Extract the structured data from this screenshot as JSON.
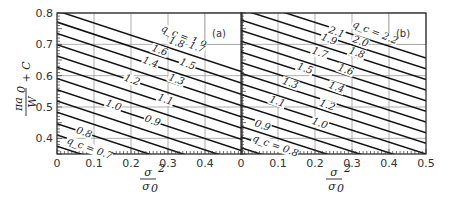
{
  "chart_data": [
    {
      "type": "line",
      "panel": "(a)",
      "title": "",
      "xlabel": "σ² / σ0²",
      "ylabel": "πa0/W + C",
      "xlim": [
        0,
        0.5
      ],
      "ylim": [
        0.35,
        0.8
      ],
      "xticks": [
        "0",
        "0.1",
        "0.2",
        "0.3",
        "0.4"
      ],
      "yticks": [
        "0.4",
        "0.5",
        "0.6",
        "0.7",
        "0.8"
      ],
      "grid": true,
      "legend": "inline curve labels (q_c values)",
      "series": [
        {
          "name": "q_c = 0.7",
          "x": [
            0,
            0.5
          ],
          "y": [
            0.375,
            0.18
          ]
        },
        {
          "name": "0.8",
          "x": [
            0,
            0.5
          ],
          "y": [
            0.411,
            0.216
          ]
        },
        {
          "name": "0.9",
          "x": [
            0,
            0.5
          ],
          "y": [
            0.447,
            0.252
          ]
        },
        {
          "name": "1.0",
          "x": [
            0,
            0.5
          ],
          "y": [
            0.483,
            0.288
          ]
        },
        {
          "name": "1.1",
          "x": [
            0,
            0.5
          ],
          "y": [
            0.519,
            0.324
          ]
        },
        {
          "name": "1.2",
          "x": [
            0,
            0.5
          ],
          "y": [
            0.555,
            0.36
          ]
        },
        {
          "name": "1.3",
          "x": [
            0,
            0.5
          ],
          "y": [
            0.591,
            0.396
          ]
        },
        {
          "name": "1.4",
          "x": [
            0,
            0.5
          ],
          "y": [
            0.627,
            0.432
          ]
        },
        {
          "name": "1.5",
          "x": [
            0,
            0.5
          ],
          "y": [
            0.663,
            0.468
          ]
        },
        {
          "name": "1.6",
          "x": [
            0,
            0.5
          ],
          "y": [
            0.699,
            0.504
          ]
        },
        {
          "name": "1.7",
          "x": [
            0,
            0.5
          ],
          "y": [
            0.735,
            0.54
          ]
        },
        {
          "name": "1.8",
          "x": [
            0,
            0.5
          ],
          "y": [
            0.771,
            0.576
          ]
        },
        {
          "name": "q_c = 1.9",
          "x": [
            0,
            0.5
          ],
          "y": [
            0.807,
            0.612
          ]
        }
      ]
    },
    {
      "type": "line",
      "panel": "(b)",
      "title": "",
      "xlabel": "σ² / σ0²",
      "ylabel": "πa0/W + C",
      "xlim": [
        0,
        0.5
      ],
      "ylim": [
        0.35,
        0.8
      ],
      "xticks": [
        "0",
        "0.1",
        "0.2",
        "0.3",
        "0.4",
        "0.5"
      ],
      "grid": true,
      "legend": "inline curve labels (q_c values)",
      "series": [
        {
          "name": "q_c = 0.8",
          "x": [
            0,
            0.5
          ],
          "y": [
            0.37,
            0.18
          ]
        },
        {
          "name": "0.9",
          "x": [
            0,
            0.5
          ],
          "y": [
            0.404,
            0.214
          ]
        },
        {
          "name": "1.0",
          "x": [
            0,
            0.5
          ],
          "y": [
            0.438,
            0.248
          ]
        },
        {
          "name": "1.1",
          "x": [
            0,
            0.5
          ],
          "y": [
            0.472,
            0.282
          ]
        },
        {
          "name": "1.2",
          "x": [
            0,
            0.5
          ],
          "y": [
            0.506,
            0.316
          ]
        },
        {
          "name": "1.3",
          "x": [
            0,
            0.5
          ],
          "y": [
            0.54,
            0.35
          ]
        },
        {
          "name": "1.4",
          "x": [
            0,
            0.5
          ],
          "y": [
            0.574,
            0.384
          ]
        },
        {
          "name": "1.5",
          "x": [
            0,
            0.5
          ],
          "y": [
            0.608,
            0.418
          ]
        },
        {
          "name": "1.6",
          "x": [
            0,
            0.5
          ],
          "y": [
            0.642,
            0.452
          ]
        },
        {
          "name": "1.7",
          "x": [
            0,
            0.5
          ],
          "y": [
            0.676,
            0.486
          ]
        },
        {
          "name": "1.8",
          "x": [
            0,
            0.5
          ],
          "y": [
            0.71,
            0.52
          ]
        },
        {
          "name": "1.9",
          "x": [
            0,
            0.5
          ],
          "y": [
            0.744,
            0.554
          ]
        },
        {
          "name": "2.0",
          "x": [
            0,
            0.5
          ],
          "y": [
            0.778,
            0.588
          ]
        },
        {
          "name": "2.1",
          "x": [
            0,
            0.5
          ],
          "y": [
            0.812,
            0.622
          ]
        },
        {
          "name": "q_c = 2.2",
          "x": [
            0,
            0.5
          ],
          "y": [
            0.846,
            0.656
          ]
        }
      ]
    }
  ],
  "labels": {
    "ylabel_top": "πa",
    "ylabel_sub": "0",
    "ylabel_den": "W",
    "ylabel_plus": "+ C",
    "xlabel_num": "σ",
    "xlabel_sup": "2",
    "xlabel_den": "σ",
    "xlabel_den_sub": "0",
    "panel_a": "(a)",
    "panel_b": "(b)"
  },
  "curve_labels_a": [
    {
      "text": "q_c = 1.9",
      "x": 0.28,
      "y": 0.743,
      "rot": 22
    },
    {
      "text": "1.8",
      "x": 0.3,
      "y": 0.705
    },
    {
      "text": "1.7",
      "x": 0.355,
      "y": 0.69
    },
    {
      "text": "1.6",
      "x": 0.255,
      "y": 0.68
    },
    {
      "text": "1.5",
      "x": 0.33,
      "y": 0.636
    },
    {
      "text": "1.4",
      "x": 0.23,
      "y": 0.642
    },
    {
      "text": "1.3",
      "x": 0.3,
      "y": 0.587
    },
    {
      "text": "1.2",
      "x": 0.18,
      "y": 0.585
    },
    {
      "text": "1.1",
      "x": 0.27,
      "y": 0.523
    },
    {
      "text": "1.0",
      "x": 0.13,
      "y": 0.505
    },
    {
      "text": "0.9",
      "x": 0.235,
      "y": 0.455
    },
    {
      "text": "0.8",
      "x": 0.05,
      "y": 0.418
    },
    {
      "text": "q_c = 0.7",
      "x": 0.025,
      "y": 0.385
    }
  ],
  "curve_labels_b": [
    {
      "text": "q_c = 2.2",
      "x": 0.3,
      "y": 0.757,
      "rot": 22
    },
    {
      "text": "2.1",
      "x": 0.235,
      "y": 0.738
    },
    {
      "text": "2.0",
      "x": 0.3,
      "y": 0.708
    },
    {
      "text": "1.9",
      "x": 0.215,
      "y": 0.715
    },
    {
      "text": "1.8",
      "x": 0.29,
      "y": 0.672
    },
    {
      "text": "1.7",
      "x": 0.19,
      "y": 0.672
    },
    {
      "text": "1.6",
      "x": 0.26,
      "y": 0.618
    },
    {
      "text": "1.5",
      "x": 0.15,
      "y": 0.622
    },
    {
      "text": "1.4",
      "x": 0.235,
      "y": 0.562
    },
    {
      "text": "1.3",
      "x": 0.11,
      "y": 0.575
    },
    {
      "text": "1.2",
      "x": 0.21,
      "y": 0.505
    },
    {
      "text": "1.1",
      "x": 0.075,
      "y": 0.517
    },
    {
      "text": "1.0",
      "x": 0.19,
      "y": 0.447
    },
    {
      "text": "0.9",
      "x": 0.035,
      "y": 0.44
    },
    {
      "text": "q_c = 0.8",
      "x": 0.03,
      "y": 0.393
    }
  ]
}
